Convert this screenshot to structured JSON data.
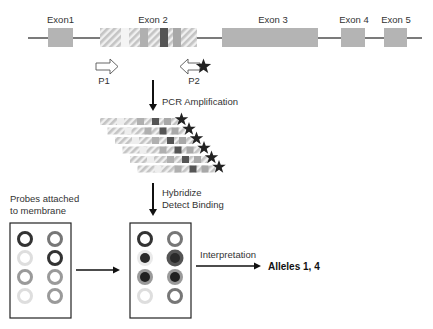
{
  "gene": {
    "exons": [
      {
        "label": "Exon1"
      },
      {
        "label": "Exon 2"
      },
      {
        "label": "Exon 3"
      },
      {
        "label": "Exon 4"
      },
      {
        "label": "Exon 5"
      }
    ]
  },
  "primers": {
    "forward": {
      "label": "P1",
      "direction": "right",
      "labeled": false
    },
    "reverse": {
      "label": "P2",
      "direction": "left",
      "labeled": true,
      "label_icon": "star-icon"
    }
  },
  "steps": {
    "pcr": "PCR Amplification",
    "hybridize": "Hybridize",
    "detect": "Detect Binding",
    "interpretation": "Interpretation"
  },
  "amplicons": {
    "count": 6,
    "tag_icon": "star-icon"
  },
  "membrane": {
    "caption_line1": "Probes attached",
    "caption_line2": "to membrane",
    "probes_before": [
      [
        "dark-ring",
        "mid-ring"
      ],
      [
        "faint-ring",
        "dark-ring"
      ],
      [
        "light-ring",
        "light-ring"
      ],
      [
        "faint-ring",
        "light-ring"
      ]
    ],
    "probes_after": [
      [
        "dark-ring",
        "mid-ring"
      ],
      [
        "bound-small",
        "bound-large"
      ],
      [
        "bound-ring",
        "bound-ring"
      ],
      [
        "faint-ring",
        "mid-ring"
      ]
    ]
  },
  "result": {
    "label": "Alleles 1, 4"
  },
  "colors": {
    "exon": "#b4b4b4",
    "hatch": "#c8c8c8",
    "variant_dark": "#555555",
    "variant_mid": "#a8a8a8",
    "line": "#222222",
    "star": "#222222"
  }
}
